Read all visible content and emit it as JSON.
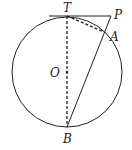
{
  "diagram": {
    "type": "geometry",
    "points": {
      "T": {
        "label": "T",
        "x": 67,
        "y": 16
      },
      "P": {
        "label": "P",
        "x": 111,
        "y": 16
      },
      "A": {
        "label": "A",
        "x": 104,
        "y": 32
      },
      "O": {
        "label": "O",
        "x": 67,
        "y": 72
      },
      "B": {
        "label": "B",
        "x": 67,
        "y": 127
      }
    },
    "circle": {
      "center": "O",
      "radius": 55
    },
    "segments": [
      {
        "from": "T",
        "to": "P",
        "style": "solid",
        "note": "tangent at T"
      },
      {
        "from": "P",
        "to": "B",
        "style": "solid",
        "note": "secant through A"
      },
      {
        "from": "T",
        "to": "B",
        "style": "dashed",
        "note": "diameter"
      },
      {
        "from": "T",
        "to": "A",
        "style": "dashed",
        "note": "chord"
      }
    ],
    "colors": {
      "stroke": "#222222",
      "background": "#ffffff"
    }
  }
}
